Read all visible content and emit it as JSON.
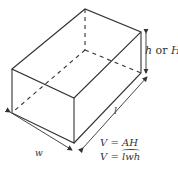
{
  "diagram": {
    "type": "rectangular-prism",
    "labels": {
      "height": {
        "var1": "h",
        "conj": " or ",
        "var2": "H"
      },
      "width": "w",
      "length": "l"
    },
    "formulas": [
      {
        "lhs": "V",
        "eq": " = ",
        "rhs": "AH"
      },
      {
        "lhs": "V",
        "eq": " = ",
        "rhs": "lwh"
      }
    ],
    "colors": {
      "line": "#333333",
      "background": "#ffffff"
    }
  }
}
